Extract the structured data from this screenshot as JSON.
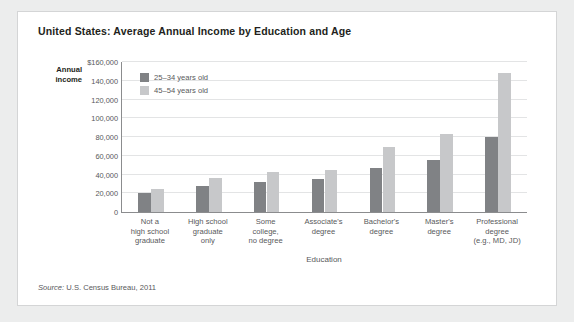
{
  "card": {
    "title": "United States: Average Annual Income by Education and Age",
    "source_label": "Source:",
    "source_text": " U.S. Census Bureau, 2011"
  },
  "axis": {
    "y_title_line1": "Annual",
    "y_title_line2": "income",
    "x_title": "Education"
  },
  "colors": {
    "series_young": "#808285",
    "series_older": "#c7c8ca",
    "axis": "#8b8c8e",
    "grid": "#e3e4e5",
    "text": "#58595b",
    "title": "#231f20",
    "card_bg": "#ffffff",
    "page_bg": "#eceded",
    "card_border": "#d4d5d6"
  },
  "chart_data": {
    "type": "bar",
    "title": "United States: Average Annual Income by Education and Age",
    "xlabel": "Education",
    "ylabel": "Annual income",
    "ylim": [
      0,
      160000
    ],
    "ytick_values": [
      0,
      20000,
      40000,
      60000,
      80000,
      100000,
      120000,
      140000,
      160000
    ],
    "ytick_labels": [
      "0",
      "20,000",
      "40,000",
      "60,000",
      "80,000",
      "100,000",
      "120,000",
      "140,000",
      "$160,000"
    ],
    "grid": true,
    "legend_position": "inside-top-left",
    "categories": [
      "Not a high school graduate",
      "High school graduate only",
      "Some college, no degree",
      "Associate's degree",
      "Bachelor's degree",
      "Master's degree",
      "Professional degree (e.g., MD, JD)"
    ],
    "category_label_lines": [
      [
        "Not a",
        "high school",
        "graduate"
      ],
      [
        "High school",
        "graduate",
        "only"
      ],
      [
        "Some",
        "college,",
        "no degree"
      ],
      [
        "Associate's",
        "degree"
      ],
      [
        "Bachelor's",
        "degree"
      ],
      [
        "Master's",
        "degree"
      ],
      [
        "Professional",
        "degree",
        "(e.g., MD, JD)"
      ]
    ],
    "series": [
      {
        "name": "25–34 years old",
        "color": "#808285",
        "values": [
          20000,
          28000,
          32000,
          35000,
          47000,
          56000,
          80000
        ]
      },
      {
        "name": "45–54 years old",
        "color": "#c7c8ca",
        "values": [
          25000,
          36000,
          43000,
          45000,
          69000,
          83000,
          148000
        ]
      }
    ]
  }
}
